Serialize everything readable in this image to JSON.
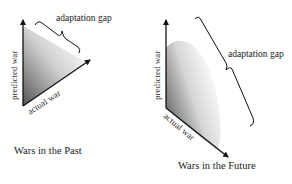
{
  "diagrams": [
    {
      "id": "past",
      "caption": "Wars in the Past",
      "y_axis_label": "predicted war",
      "x_axis_label": "actual war",
      "gap_label": "adaptation gap"
    },
    {
      "id": "future",
      "caption": "Wars in the Future",
      "y_axis_label": "predicted war",
      "x_axis_label": "actual war",
      "gap_label": "adaptation gap"
    }
  ],
  "colors": {
    "line": "#111111",
    "gradient_dark": "#555555",
    "gradient_light": "#ffffff",
    "text": "#222222"
  }
}
